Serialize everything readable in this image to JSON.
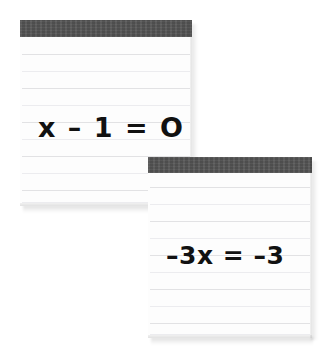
{
  "scene": {
    "title": "Two lined notepads with algebra steps",
    "background_color": "#ffffff"
  },
  "style": {
    "header_band_color": "#545454",
    "paper_color": "#fdfdfd",
    "rule_line_color": "#e2e2e4",
    "ink_color": "#111111"
  },
  "notepads": [
    {
      "id": "notepad-top-left",
      "equation": "x – 1 = O",
      "header_label": "",
      "rule_count": 10,
      "position": {
        "x": 20,
        "y": 20,
        "width": 172,
        "height": 186
      },
      "header_height": 17,
      "rule_spacing": 17
    },
    {
      "id": "notepad-bottom-right",
      "equation": "–3x = –3",
      "header_label": "",
      "rule_count": 10,
      "position": {
        "x": 148,
        "y": 157,
        "width": 164,
        "height": 181
      },
      "header_height": 16,
      "rule_spacing": 17
    }
  ]
}
